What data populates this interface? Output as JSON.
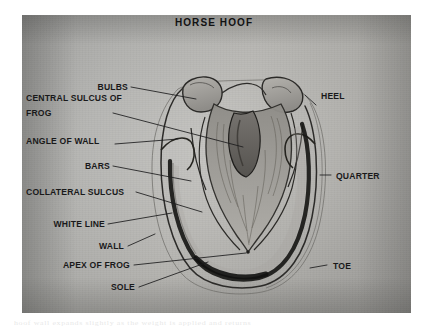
{
  "figure": {
    "title": "HORSE HOOF",
    "kind": "anatomical-diagram",
    "medium": "pencil sketch photograph",
    "background_color": "#b2b2af",
    "ink_color": "#1b1b1c",
    "bleed_text": "hoof wall  expands  slightly  as  the  weight  is  applied  and  returns"
  },
  "labels_left": [
    {
      "id": "bulbs",
      "text": "BULBS"
    },
    {
      "id": "central-sulcus-of-frog-1",
      "text": "CENTRAL SULCUS OF"
    },
    {
      "id": "central-sulcus-of-frog-2",
      "text": "FROG"
    },
    {
      "id": "angle-of-wall",
      "text": "ANGLE OF WALL"
    },
    {
      "id": "bars",
      "text": "BARS"
    },
    {
      "id": "collateral-sulcus",
      "text": "COLLATERAL SULCUS"
    },
    {
      "id": "white-line",
      "text": "WHITE LINE"
    },
    {
      "id": "wall",
      "text": "WALL"
    },
    {
      "id": "apex-of-frog",
      "text": "APEX OF FROG"
    },
    {
      "id": "sole",
      "text": "SOLE"
    }
  ],
  "labels_right": [
    {
      "id": "heel",
      "text": "HEEL"
    },
    {
      "id": "quarter",
      "text": "QUARTER"
    },
    {
      "id": "toe",
      "text": "TOE"
    }
  ]
}
